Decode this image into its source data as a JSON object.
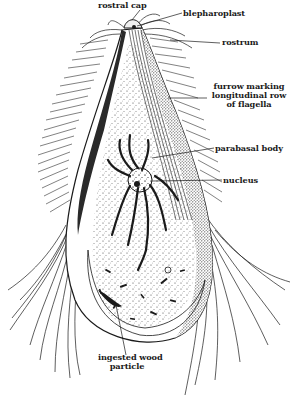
{
  "figure": {
    "ink_color": "#1a1a1a",
    "background": "#ffffff"
  },
  "labels": {
    "rostral_cap": "rostral cap",
    "blepharoplast": "blepharoplast",
    "rostrum": "rostrum",
    "furrow": [
      "furrow marking",
      "longitudinal row",
      "of flagella"
    ],
    "parabasal_body": "parabasal body",
    "nucleus": "nucleus",
    "ingested_wood": [
      "ingested wood",
      "particle"
    ]
  }
}
